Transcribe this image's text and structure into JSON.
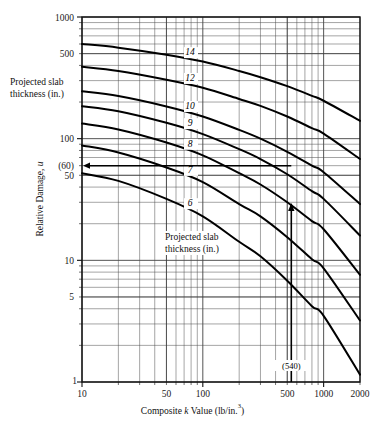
{
  "chart_data": {
    "type": "line",
    "title": "",
    "xlabel": "Composite k Value (lb/in.3)",
    "ylabel": "Relative Damage, u",
    "xscale": "log",
    "yscale": "log",
    "xlim": [
      10,
      2000
    ],
    "ylim": [
      1,
      1000
    ],
    "grid": true,
    "grid_style": "log-log minor gridlines",
    "legend": "inline curve labels",
    "legend_position": "on-curve",
    "series_label_title": "Projected slab thickness (in.)",
    "xticks": [
      10,
      50,
      100,
      500,
      1000,
      2000
    ],
    "xticklabels": [
      "10",
      "50",
      "100",
      "500",
      "1000",
      "2000"
    ],
    "yticks": [
      1,
      5,
      10,
      50,
      100,
      500,
      1000
    ],
    "yticklabels": [
      "1",
      "5",
      "10",
      "50",
      "100",
      "500",
      "1000"
    ],
    "extra_yticklabels": [
      {
        "value": 60,
        "label": "(60)"
      }
    ],
    "series": [
      {
        "name": "14",
        "label": "14",
        "x": [
          10,
          20,
          50,
          100,
          200,
          300,
          500,
          800,
          1000,
          2000
        ],
        "y": [
          600,
          560,
          490,
          430,
          360,
          320,
          270,
          225,
          205,
          140
        ]
      },
      {
        "name": "12",
        "label": "12",
        "x": [
          10,
          20,
          50,
          100,
          200,
          300,
          500,
          800,
          1000,
          2000
        ],
        "y": [
          390,
          360,
          305,
          262,
          212,
          186,
          152,
          122,
          110,
          68
        ]
      },
      {
        "name": "10",
        "label": "10",
        "x": [
          10,
          20,
          50,
          100,
          200,
          300,
          500,
          800,
          1000,
          2000
        ],
        "y": [
          245,
          224,
          184,
          152,
          118,
          100,
          78,
          60,
          53,
          29
        ]
      },
      {
        "name": "9",
        "label": "9",
        "x": [
          10,
          20,
          50,
          100,
          200,
          300,
          500,
          800,
          1000,
          2000
        ],
        "y": [
          185,
          168,
          135,
          109,
          82,
          68,
          51,
          37,
          32,
          16
        ]
      },
      {
        "name": "8",
        "label": "8",
        "x": [
          10,
          20,
          50,
          100,
          200,
          300,
          500,
          800,
          1000,
          2000
        ],
        "y": [
          133,
          119,
          93,
          73,
          52,
          42,
          30,
          21,
          18,
          7.6
        ]
      },
      {
        "name": "7",
        "label": "7",
        "x": [
          10,
          20,
          50,
          100,
          200,
          300,
          500,
          800,
          1000,
          2000
        ],
        "y": [
          88,
          77,
          58,
          44,
          29,
          23,
          15.5,
          10.2,
          8.6,
          3.2
        ]
      },
      {
        "name": "6",
        "label": "6",
        "x": [
          10,
          20,
          50,
          100,
          200,
          300,
          500,
          800,
          1000,
          2000
        ],
        "y": [
          52,
          45,
          32,
          23,
          14.2,
          10.8,
          6.8,
          4.2,
          3.5,
          1.15
        ]
      }
    ],
    "annotations": [
      {
        "name": "k-value-marker",
        "text": "(540)",
        "x": 540,
        "axis": "x",
        "kind": "vertical-line-with-label"
      },
      {
        "name": "damage-marker",
        "text": "(60)",
        "y": 60,
        "axis": "y",
        "kind": "horizontal-arrow-to-axis"
      },
      {
        "name": "arrowhead-on-curve-8",
        "text": "",
        "x": 540,
        "y": 29,
        "kind": "up-arrow"
      }
    ]
  },
  "labels": {
    "outer_block": {
      "line1": "Projected slab",
      "line2": "thickness (in.)"
    },
    "inner_block": {
      "line1": "Projected slab",
      "line2": "thickness (in.)"
    },
    "x_axis_title_pre": "Composite ",
    "x_axis_title_k": "k",
    "x_axis_title_mid": " Value (lb/in.",
    "x_axis_title_sup": "3",
    "x_axis_title_post": ")",
    "y_axis_title_pre": "Relative Damage, ",
    "y_axis_title_u": "u"
  }
}
